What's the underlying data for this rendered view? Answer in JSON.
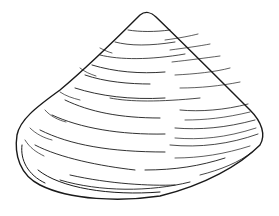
{
  "image": {
    "subject": "cone-shaped bivalve shell line drawing",
    "background_color": "#ffffff",
    "ink_color": "#1a1a1a"
  }
}
